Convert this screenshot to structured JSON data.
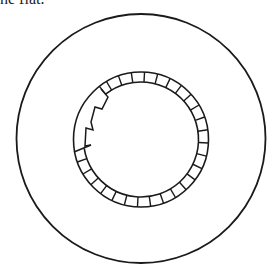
{
  "caption": {
    "text": "he flat."
  },
  "diagram": {
    "stroke_color": "#1a1a1a",
    "background": "#ffffff",
    "outer_circle": {
      "cx": 141,
      "cy": 138.5,
      "r": 124.5,
      "stroke_width": 1.8
    },
    "ring": {
      "cx": 141,
      "cy": 139.5,
      "outer_r": 67.5,
      "inner_r": 57.5,
      "stroke_width": 1.6,
      "segment_count": 32,
      "segment_start_deg": 3,
      "gap_start_deg": 171,
      "gap_end_deg": 232
    },
    "damaged_contour": {
      "points": [
        [
          101,
          89
        ],
        [
          108,
          97
        ],
        [
          102,
          109
        ],
        [
          95,
          107
        ],
        [
          91,
          122
        ],
        [
          93,
          130
        ],
        [
          86,
          128
        ],
        [
          85,
          146
        ],
        [
          91,
          145
        ]
      ],
      "diagonal": [
        [
          74,
          152
        ],
        [
          91,
          145
        ]
      ]
    }
  }
}
